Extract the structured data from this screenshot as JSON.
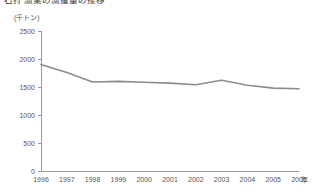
{
  "chart_data": {
    "type": "line",
    "title": "石狩 漁業の漁獲量の推移",
    "unit_label": "(千トン)",
    "xlabel": "年",
    "ylabel": "",
    "categories": [
      "1996",
      "1997",
      "1998",
      "1999",
      "2000",
      "2001",
      "2002",
      "2003",
      "2004",
      "2005",
      "2006"
    ],
    "values": [
      1900,
      1760,
      1590,
      1600,
      1585,
      1570,
      1540,
      1620,
      1530,
      1480,
      1470
    ],
    "ylim": [
      0,
      2500
    ],
    "ytick_values": [
      0,
      500,
      1000,
      1500,
      2000,
      2500
    ],
    "ytick_labels": [
      "0",
      "500",
      "1000",
      "1500",
      "2000",
      "2500"
    ],
    "grid": false,
    "legend": false,
    "series": [
      {
        "name": "漁獲量",
        "color": "#8c8c8c",
        "values": [
          1900,
          1760,
          1590,
          1600,
          1585,
          1570,
          1540,
          1620,
          1530,
          1480,
          1470
        ]
      }
    ],
    "axis_color": "#9a9a9a",
    "text_color": "#555555"
  }
}
